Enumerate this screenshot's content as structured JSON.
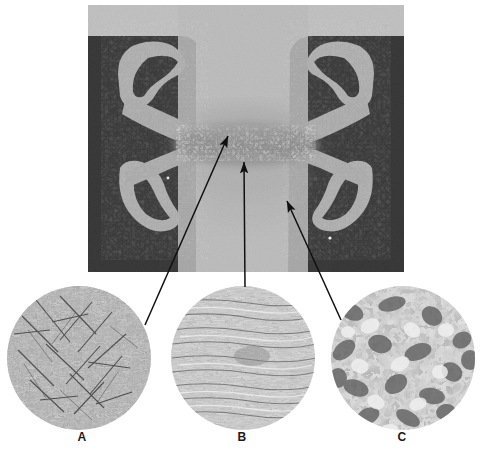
{
  "figure": {
    "type": "metallurgical-figure",
    "macrograph": {
      "name": "weld-cross-section",
      "bounds": {
        "x": 88,
        "y": 5,
        "width": 316,
        "height": 267
      },
      "colors": {
        "background_light": "#c9c9c9",
        "base_metal": "#b4b4b4",
        "dark_field": "#121212",
        "weld_nugget": "#8e8e8e",
        "fusion_zone": "#a8a8a8",
        "highlight": "#d8d8d8"
      }
    },
    "micrographs": [
      {
        "id": "A",
        "label": "A",
        "name": "micrograph-a",
        "center": {
          "x": 79,
          "y": 358
        },
        "radius": 72,
        "texture": "acicular-martensite",
        "tone_light": "#bdbdbd",
        "tone_dark": "#4a4a4a"
      },
      {
        "id": "B",
        "label": "B",
        "name": "micrograph-b",
        "center": {
          "x": 243,
          "y": 358
        },
        "radius": 72,
        "texture": "banded-rolled-structure",
        "tone_light": "#d2d2d2",
        "tone_dark": "#555555"
      },
      {
        "id": "C",
        "label": "C",
        "name": "micrograph-c",
        "center": {
          "x": 403,
          "y": 358
        },
        "radius": 72,
        "texture": "coarse-ferrite-pearlite",
        "tone_light": "#dcdcdc",
        "tone_dark": "#636363"
      }
    ],
    "leaders": [
      {
        "name": "leader-a",
        "from_label": "A",
        "arrow_tip": {
          "x": 226,
          "y": 133
        },
        "line_start": {
          "x": 145,
          "y": 325
        },
        "stroke": "#111111"
      },
      {
        "name": "leader-b",
        "from_label": "B",
        "arrow_tip": {
          "x": 244,
          "y": 160
        },
        "line_start": {
          "x": 245,
          "y": 287
        },
        "stroke": "#111111"
      },
      {
        "name": "leader-c",
        "from_label": "C",
        "arrow_tip": {
          "x": 285,
          "y": 199
        },
        "line_start": {
          "x": 341,
          "y": 320
        },
        "stroke": "#111111"
      }
    ],
    "label_color": "#1a1a1a"
  }
}
